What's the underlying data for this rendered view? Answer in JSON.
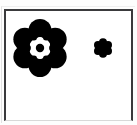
{
  "panel": {
    "background_color": "#ffffff",
    "border_color": "#3a3a3c",
    "border_bottom_color": "#d8d8d8",
    "page_background_color": "#fdfdfd"
  },
  "figure": {
    "ink_color": "#000000",
    "gap_color": "#ffffff",
    "caption": "",
    "shapes": [
      {
        "name": "rosette-large",
        "label": "large six-petal rosette",
        "center_x": 44,
        "center_y": 57,
        "outer_radius": 30,
        "petal_count": 6,
        "petal_radius": 11.5,
        "petal_ring_radius": 17.5,
        "core_dot_radius": 4.2,
        "inner_gap_radius": 10.5,
        "has_inner_gap": true,
        "has_core_dot": true
      },
      {
        "name": "rosette-small",
        "label": "small six-petal rosette",
        "center_x": 107,
        "center_y": 57,
        "outer_radius": 10,
        "petal_count": 6,
        "petal_radius": 4.0,
        "petal_ring_radius": 5.8,
        "core_dot_radius": 0,
        "inner_gap_radius": 0,
        "has_inner_gap": false,
        "has_core_dot": false
      }
    ]
  }
}
